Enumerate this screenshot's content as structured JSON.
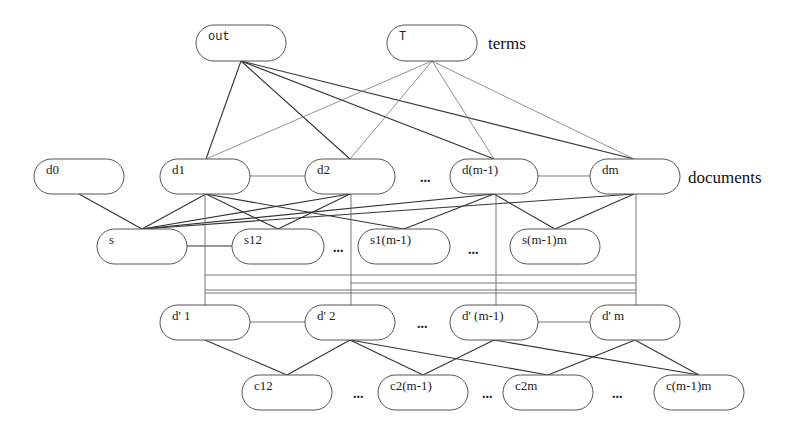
{
  "layer_labels": {
    "terms": "terms",
    "documents": "documents"
  },
  "nodes": {
    "out": {
      "label": "out",
      "x": 196,
      "y": 25,
      "w": 90,
      "h": 36
    },
    "T": {
      "label": "T",
      "x": 387,
      "y": 25,
      "w": 90,
      "h": 36
    },
    "d0": {
      "label": "d0",
      "x": 34,
      "y": 159,
      "w": 90,
      "h": 35
    },
    "d1": {
      "label": "d1",
      "x": 160,
      "y": 159,
      "w": 90,
      "h": 35
    },
    "d2": {
      "label": "d2",
      "x": 305,
      "y": 159,
      "w": 90,
      "h": 35
    },
    "dm1": {
      "label": "d(m-1)",
      "x": 450,
      "y": 159,
      "w": 88,
      "h": 35
    },
    "dm": {
      "label": "dm",
      "x": 590,
      "y": 159,
      "w": 90,
      "h": 35
    },
    "s": {
      "label": "s",
      "x": 97,
      "y": 229,
      "w": 90,
      "h": 35
    },
    "s12": {
      "label": "s12",
      "x": 232,
      "y": 229,
      "w": 92,
      "h": 35
    },
    "s1m1": {
      "label": "s1(m-1)",
      "x": 358,
      "y": 229,
      "w": 92,
      "h": 35
    },
    "sm1m": {
      "label": "s(m-1)m",
      "x": 510,
      "y": 229,
      "w": 90,
      "h": 35
    },
    "dp1": {
      "label": "d' 1",
      "x": 160,
      "y": 305,
      "w": 90,
      "h": 35
    },
    "dp2": {
      "label": "d' 2",
      "x": 305,
      "y": 305,
      "w": 90,
      "h": 35
    },
    "dpm1": {
      "label": "d' (m-1)",
      "x": 450,
      "y": 305,
      "w": 88,
      "h": 35
    },
    "dpm": {
      "label": "d' m",
      "x": 590,
      "y": 305,
      "w": 90,
      "h": 35
    },
    "c12": {
      "label": "c12",
      "x": 242,
      "y": 375,
      "w": 90,
      "h": 35
    },
    "c2m1": {
      "label": "c2(m-1)",
      "x": 378,
      "y": 375,
      "w": 90,
      "h": 35
    },
    "c2m": {
      "label": "c2m",
      "x": 503,
      "y": 375,
      "w": 90,
      "h": 35
    },
    "cm1m": {
      "label": "c(m-1)m",
      "x": 654,
      "y": 375,
      "w": 90,
      "h": 35
    }
  },
  "ellipses": [
    {
      "x": 420,
      "y": 182,
      "text": "..."
    },
    {
      "x": 333,
      "y": 252,
      "text": "..."
    },
    {
      "x": 468,
      "y": 254,
      "text": "..."
    },
    {
      "x": 417,
      "y": 328,
      "text": "..."
    },
    {
      "x": 353,
      "y": 398,
      "text": "..."
    },
    {
      "x": 482,
      "y": 398,
      "text": "..."
    },
    {
      "x": 612,
      "y": 398,
      "text": "..."
    }
  ],
  "edges": {
    "term_doc": [
      {
        "from": [
          241,
          61
        ],
        "to": [
          206,
          159
        ]
      },
      {
        "from": [
          241,
          61
        ],
        "to": [
          350,
          159
        ]
      },
      {
        "from": [
          241,
          61
        ],
        "to": [
          494,
          159
        ]
      },
      {
        "from": [
          241,
          61
        ],
        "to": [
          634,
          159
        ]
      },
      {
        "from": [
          432,
          61
        ],
        "to": [
          206,
          159
        ],
        "thin": true
      },
      {
        "from": [
          432,
          61
        ],
        "to": [
          350,
          159
        ],
        "thin": true
      },
      {
        "from": [
          432,
          61
        ],
        "to": [
          494,
          159
        ],
        "thin": true
      },
      {
        "from": [
          432,
          61
        ],
        "to": [
          634,
          159
        ],
        "thin": true
      }
    ],
    "doc_chain": [
      {
        "from": [
          250,
          176
        ],
        "to": [
          305,
          176
        ]
      },
      {
        "from": [
          538,
          176
        ],
        "to": [
          590,
          176
        ]
      }
    ],
    "doc_sim": [
      {
        "from": [
          79,
          194
        ],
        "to": [
          142,
          229
        ]
      },
      {
        "from": [
          206,
          194
        ],
        "to": [
          142,
          229
        ]
      },
      {
        "from": [
          350,
          194
        ],
        "to": [
          142,
          229
        ]
      },
      {
        "from": [
          494,
          194
        ],
        "to": [
          142,
          229
        ]
      },
      {
        "from": [
          634,
          194
        ],
        "to": [
          142,
          229
        ]
      },
      {
        "from": [
          206,
          194
        ],
        "to": [
          278,
          229
        ]
      },
      {
        "from": [
          350,
          194
        ],
        "to": [
          278,
          229
        ]
      },
      {
        "from": [
          206,
          194
        ],
        "to": [
          404,
          229
        ]
      },
      {
        "from": [
          494,
          194
        ],
        "to": [
          404,
          229
        ]
      },
      {
        "from": [
          494,
          194
        ],
        "to": [
          555,
          229
        ]
      },
      {
        "from": [
          634,
          194
        ],
        "to": [
          555,
          229
        ]
      }
    ],
    "sim_chain": [
      {
        "from": [
          187,
          246
        ],
        "to": [
          232,
          246
        ]
      }
    ],
    "verticals": [
      {
        "from": [
          205,
          194
        ],
        "to": [
          205,
          305
        ]
      },
      {
        "from": [
          351,
          194
        ],
        "to": [
          351,
          305
        ]
      },
      {
        "from": [
          496,
          194
        ],
        "to": [
          496,
          305
        ]
      },
      {
        "from": [
          636,
          194
        ],
        "to": [
          636,
          305
        ]
      }
    ],
    "routes": [
      {
        "from": [
          205,
          275
        ],
        "to": [
          636,
          275
        ]
      },
      {
        "from": [
          351,
          283
        ],
        "to": [
          636,
          283
        ]
      },
      {
        "from": [
          205,
          290
        ],
        "to": [
          636,
          290
        ]
      },
      {
        "from": [
          205,
          293
        ],
        "to": [
          636,
          293
        ]
      }
    ],
    "dprime_chain": [
      {
        "from": [
          250,
          322
        ],
        "to": [
          305,
          322
        ]
      },
      {
        "from": [
          538,
          322
        ],
        "to": [
          590,
          322
        ]
      }
    ],
    "dprime_c": [
      {
        "from": [
          205,
          340
        ],
        "to": [
          287,
          375
        ]
      },
      {
        "from": [
          350,
          340
        ],
        "to": [
          287,
          375
        ]
      },
      {
        "from": [
          350,
          340
        ],
        "to": [
          423,
          375
        ]
      },
      {
        "from": [
          494,
          340
        ],
        "to": [
          423,
          375
        ]
      },
      {
        "from": [
          350,
          340
        ],
        "to": [
          548,
          375
        ]
      },
      {
        "from": [
          635,
          340
        ],
        "to": [
          548,
          375
        ]
      },
      {
        "from": [
          494,
          340
        ],
        "to": [
          699,
          375
        ]
      },
      {
        "from": [
          635,
          340
        ],
        "to": [
          699,
          375
        ]
      }
    ]
  }
}
